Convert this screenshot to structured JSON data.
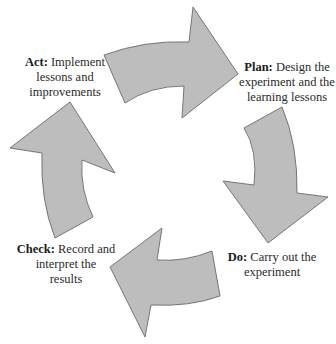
{
  "diagram": {
    "type": "cycle",
    "colors": {
      "arrow_fill": "#bdbdbd",
      "arrow_stroke": "#6a6a6a",
      "text": "#2a2a2a",
      "background": "#ffffff"
    },
    "stages": {
      "plan": {
        "keyword": "Plan:",
        "lines": [
          "Design the",
          "experiment and the",
          "learning lessons"
        ]
      },
      "do": {
        "keyword": "Do:",
        "lines": [
          "Carry out the",
          "experiment"
        ]
      },
      "check": {
        "keyword": "Check:",
        "lines": [
          "Record and",
          "interpret the",
          "results"
        ]
      },
      "act": {
        "keyword": "Act:",
        "lines": [
          "Implement",
          "lessons and",
          "improvements"
        ]
      }
    },
    "arrows": [
      {
        "name": "act-to-plan",
        "direction": "right"
      },
      {
        "name": "plan-to-do",
        "direction": "down"
      },
      {
        "name": "do-to-check",
        "direction": "left"
      },
      {
        "name": "check-to-act",
        "direction": "up"
      }
    ]
  }
}
